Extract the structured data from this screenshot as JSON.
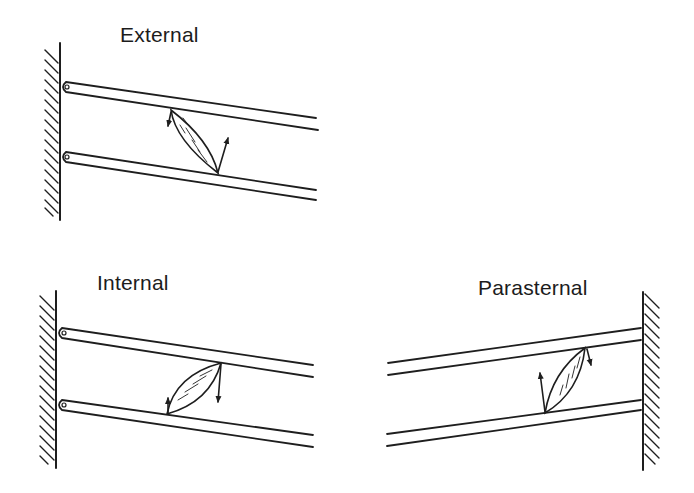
{
  "figure": {
    "type": "diagram",
    "colors": {
      "ink": "#1e1e1e",
      "background": "#ffffff"
    },
    "panels": [
      {
        "id": "external",
        "label": "External",
        "wall_side": "left",
        "muscle_orientation": "downward-forward",
        "arrows": [
          "upper-rib-down-small",
          "lower-rib-up-large"
        ]
      },
      {
        "id": "internal",
        "label": "Internal",
        "wall_side": "left",
        "muscle_orientation": "upward-forward",
        "arrows": [
          "upper-rib-down-large",
          "lower-rib-up-small"
        ]
      },
      {
        "id": "parasternal",
        "label": "Parasternal",
        "wall_side": "right",
        "muscle_orientation": "upward-toward-sternum",
        "arrows": [
          "upper-rib-down-small",
          "lower-rib-up-large"
        ]
      }
    ]
  }
}
